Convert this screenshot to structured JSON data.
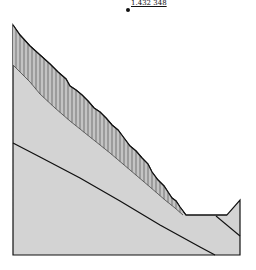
{
  "diagram": {
    "type": "slope-stability-slices",
    "factor_of_safety_label": "1.432 348",
    "colors": {
      "background": "#ffffff",
      "soil_fill": "#d3d3d3",
      "slice_fill": "#c4c4c4",
      "slice_line": "#555555",
      "outline": "#111111"
    },
    "critical_center": {
      "x": 128,
      "y": 10
    },
    "ground_surface": [
      [
        13,
        25
      ],
      [
        20,
        35
      ],
      [
        30,
        46
      ],
      [
        40,
        55
      ],
      [
        50,
        64
      ],
      [
        58,
        72
      ],
      [
        66,
        79
      ],
      [
        70,
        86
      ],
      [
        76,
        90
      ],
      [
        82,
        95
      ],
      [
        88,
        101
      ],
      [
        94,
        108
      ],
      [
        100,
        112
      ],
      [
        106,
        118
      ],
      [
        112,
        125
      ],
      [
        118,
        130
      ],
      [
        124,
        138
      ],
      [
        130,
        146
      ],
      [
        136,
        151
      ],
      [
        142,
        158
      ],
      [
        148,
        164
      ],
      [
        152,
        172
      ],
      [
        158,
        180
      ],
      [
        164,
        186
      ],
      [
        168,
        192
      ],
      [
        172,
        198
      ],
      [
        176,
        201
      ],
      [
        180,
        207
      ],
      [
        186,
        215
      ],
      [
        227,
        215
      ],
      [
        240,
        200
      ],
      [
        240,
        255
      ],
      [
        13,
        255
      ]
    ],
    "slip_surface": [
      [
        13,
        65
      ],
      [
        20,
        72
      ],
      [
        30,
        82
      ],
      [
        40,
        94
      ],
      [
        55,
        108
      ],
      [
        70,
        121
      ],
      [
        90,
        137
      ],
      [
        110,
        153
      ],
      [
        130,
        170
      ],
      [
        150,
        187
      ],
      [
        165,
        200
      ],
      [
        175,
        208
      ],
      [
        183,
        215
      ]
    ],
    "soil_boundary": [
      [
        13,
        143
      ],
      [
        40,
        157
      ],
      [
        80,
        178
      ],
      [
        120,
        201
      ],
      [
        160,
        225
      ],
      [
        200,
        247
      ],
      [
        215,
        255
      ]
    ],
    "secondary_boundary": [
      [
        216,
        216
      ],
      [
        240,
        236
      ]
    ],
    "slice_x_positions": [
      16,
      20,
      24,
      28,
      32,
      36,
      40,
      44,
      48,
      52,
      56,
      60,
      64,
      68,
      72,
      76,
      80,
      84,
      88,
      92,
      96,
      100,
      104,
      108,
      112,
      116,
      120,
      124,
      128,
      132,
      136,
      140,
      144,
      148,
      152,
      156,
      160,
      164,
      168,
      172,
      176,
      180
    ]
  }
}
